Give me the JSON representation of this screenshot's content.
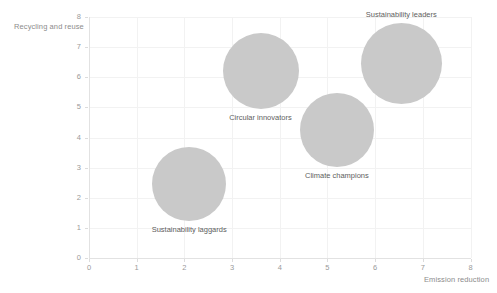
{
  "chart_data": {
    "type": "scatter",
    "title": "",
    "xlabel": "Emission reduction",
    "ylabel": "Recycling and reuse",
    "xlim": [
      0,
      8
    ],
    "ylim": [
      0,
      8
    ],
    "xticks": [
      "0",
      "1",
      "2",
      "3",
      "4",
      "5",
      "6",
      "7",
      "8"
    ],
    "yticks": [
      "0",
      "1",
      "2",
      "3",
      "4",
      "5",
      "6",
      "7",
      "8"
    ],
    "grid": true,
    "legend": "none",
    "bubble_color": "#c9c9c9",
    "points": [
      {
        "label": "Sustainability leaders",
        "x": 6.55,
        "y": 6.45,
        "size": 3.4,
        "label_position": "above"
      },
      {
        "label": "Circular innovators",
        "x": 3.6,
        "y": 6.2,
        "size": 3.2,
        "label_position": "below"
      },
      {
        "label": "Climate champions",
        "x": 5.2,
        "y": 4.25,
        "size": 3.1,
        "label_position": "below"
      },
      {
        "label": "Sustainability laggards",
        "x": 2.1,
        "y": 2.45,
        "size": 3.1,
        "label_position": "below"
      }
    ]
  }
}
